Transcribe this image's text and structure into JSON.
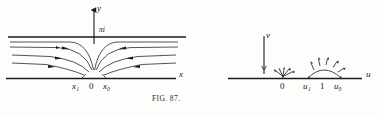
{
  "figure": {
    "caption": "FIG. 87.",
    "caption_prefix": "F",
    "caption_smallcaps": "IG",
    "caption_suffix": ". 87.",
    "ink_color": "#1a1a1a",
    "paper_color": "#fdfdfc"
  },
  "left_diagram": {
    "name": "z-plane-strip-flow",
    "axis_vertical_label": "y",
    "axis_horizontal_label": "x",
    "strip_top_label": "πi",
    "points": [
      {
        "label_base": "x",
        "label_sub": "1",
        "x": 78,
        "y": 78
      },
      {
        "label_base": "0",
        "label_sub": "",
        "x": 94,
        "y": 78
      },
      {
        "label_base": "x",
        "label_sub": "0",
        "x": 110,
        "y": 78
      }
    ],
    "tick_labels": [
      "x₁",
      "0",
      "x₀"
    ],
    "boundary_top_y": 37,
    "boundary_bottom_y": 78,
    "source_x": 94
  },
  "right_diagram": {
    "name": "uv-plane-half-plane",
    "axis_vertical_label": "v",
    "axis_horizontal_label": "u",
    "points": [
      {
        "label": "0",
        "x": 283,
        "y": 78
      },
      {
        "label_base": "u",
        "label_sub": "1",
        "x": 309,
        "y": 78
      },
      {
        "label": "1",
        "x": 324,
        "y": 78
      },
      {
        "label_base": "u",
        "label_sub": "0",
        "x": 341,
        "y": 78
      }
    ],
    "tick_labels": [
      "0",
      "u₁",
      "1",
      "u₀"
    ],
    "baseline_y": 78
  }
}
